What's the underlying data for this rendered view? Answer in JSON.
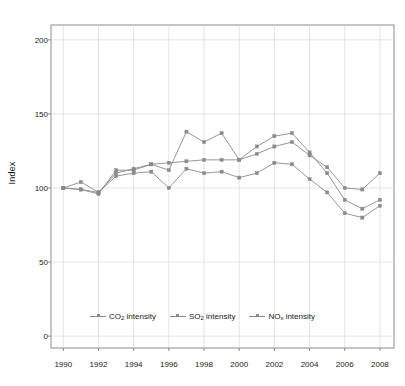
{
  "chart_data": {
    "type": "line",
    "title": "",
    "xlabel": "",
    "ylabel": "Index",
    "x": [
      1990,
      1991,
      1992,
      1993,
      1994,
      1995,
      1996,
      1997,
      1998,
      1999,
      2000,
      2001,
      2002,
      2003,
      2004,
      2005,
      2006,
      2007,
      2008
    ],
    "xlim": [
      1989.3,
      2008.8
    ],
    "ylim": [
      -8,
      210
    ],
    "xticks": [
      1990,
      1992,
      1994,
      1996,
      1998,
      2000,
      2002,
      2004,
      2006,
      2008
    ],
    "xticklabels": [
      "1990",
      "1992",
      "1994",
      "1996",
      "1998",
      "2000",
      "2002",
      "2004",
      "2006",
      "2008"
    ],
    "yticks": [
      0,
      50,
      100,
      150,
      200
    ],
    "yticklabels": [
      "0",
      "50",
      "100",
      "150",
      "200"
    ],
    "grid": true,
    "legend_position": "bottom-center",
    "series": [
      {
        "name": "CO2 intensity",
        "label_html": "CO<sub>2</sub> intensity",
        "color": "#8a8a8a",
        "marker": "square",
        "values": [
          100,
          99,
          96,
          112,
          112,
          116,
          117,
          118,
          119,
          119,
          119,
          123,
          128,
          131,
          122,
          114,
          100,
          99,
          110
        ]
      },
      {
        "name": "SO2 intensity",
        "label_html": "SO<sub>2</sub> intensity",
        "color": "#8a8a8a",
        "marker": "square",
        "values": [
          100,
          104,
          97,
          110,
          113,
          116,
          112,
          138,
          131,
          137,
          119,
          128,
          135,
          137,
          124,
          110,
          92,
          86,
          92
        ]
      },
      {
        "name": "NOx intensity",
        "label_html": "NO<sub>x</sub> intensity",
        "color": "#8a8a8a",
        "marker": "square",
        "values": [
          100,
          99,
          97,
          108,
          110,
          111,
          100,
          113,
          110,
          111,
          107,
          110,
          117,
          116,
          106,
          97,
          83,
          80,
          88
        ]
      }
    ]
  }
}
